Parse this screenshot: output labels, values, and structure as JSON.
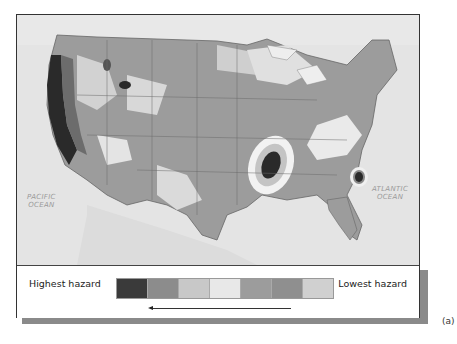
{
  "map": {
    "title": "Seismic hazard map of the contiguous United States",
    "ocean_labels": [
      {
        "line1": "PACIFIC",
        "line2": "OCEAN"
      },
      {
        "line1": "ATLANTIC",
        "line2": "OCEAN"
      }
    ],
    "colors": {
      "ocean": "#e4e4e4",
      "land_mid": "#9a9a9a",
      "land_light": "#d2d2d2",
      "land_pale": "#efefef",
      "hazard_high": "#2e2e2e",
      "border": "#6a6a6a"
    }
  },
  "legend": {
    "highest_label": "Highest  hazard",
    "lowest_label": "Lowest hazard",
    "swatches": [
      "#3a3a3a",
      "#8c8c8c",
      "#c8c8c8",
      "#e8e8e8",
      "#9c9c9c",
      "#8f8f8f",
      "#d0d0d0"
    ],
    "arrow_direction": "left"
  },
  "caption": "(a)"
}
